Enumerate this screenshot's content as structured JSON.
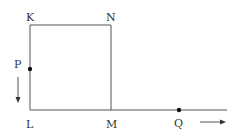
{
  "diagram": {
    "type": "geometry-motion",
    "colors": {
      "line": "#555555",
      "dot": "#111111",
      "text": "#333333",
      "background": "#ffffff"
    },
    "points": {
      "K": {
        "label": "K"
      },
      "N": {
        "label": "N"
      },
      "L": {
        "label": "L"
      },
      "M": {
        "label": "M"
      },
      "P": {
        "label": "P"
      },
      "Q": {
        "label": "Q"
      }
    },
    "shapes": [
      {
        "name": "square KNML",
        "vertices": [
          "K",
          "N",
          "M",
          "L"
        ]
      },
      {
        "name": "ray from L through M",
        "from": "L",
        "to": "right"
      }
    ],
    "arrows": [
      {
        "near": "P",
        "direction": "down"
      },
      {
        "near": "Q",
        "direction": "right"
      }
    ]
  }
}
